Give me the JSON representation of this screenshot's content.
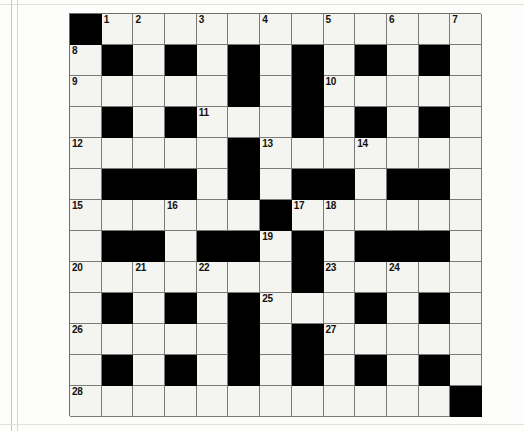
{
  "puzzle": {
    "title": "Crossword Grid",
    "rows": 13,
    "columns": 13,
    "cell_size_px": 31,
    "colors": {
      "block": "#000000",
      "open_cell": "#f4f4f0",
      "grid_line": "#7a7a7a",
      "number_text": "#111111",
      "paper": "#fdfdfb"
    },
    "grid": [
      [
        "#",
        "1",
        "2",
        "",
        "3",
        "",
        "4",
        "",
        "5",
        "",
        "6",
        "",
        "7"
      ],
      [
        "8",
        "#",
        "",
        "#",
        "",
        "#",
        "",
        "#",
        "",
        "#",
        "",
        "#",
        ""
      ],
      [
        "9",
        "",
        "",
        "",
        "",
        "#",
        "",
        "#",
        "10",
        "",
        "",
        "",
        ""
      ],
      [
        "",
        "#",
        "",
        "#",
        "11",
        "",
        "",
        "#",
        "",
        "#",
        "",
        "#",
        ""
      ],
      [
        "12",
        "",
        "",
        "",
        "",
        "#",
        "13",
        "",
        "",
        "14",
        "",
        "",
        ""
      ],
      [
        "",
        "#",
        "#",
        "#",
        "",
        "#",
        "",
        "#",
        "#",
        "",
        "#",
        "#",
        ""
      ],
      [
        "15",
        "",
        "",
        "16",
        "",
        "",
        "#",
        "17",
        "18",
        "",
        "",
        "",
        ""
      ],
      [
        "",
        "#",
        "#",
        "",
        "#",
        "#",
        "19",
        "#",
        "",
        "#",
        "#",
        "#",
        ""
      ],
      [
        "20",
        "",
        "21",
        "",
        "22",
        "",
        "",
        "#",
        "23",
        "",
        "24",
        "",
        ""
      ],
      [
        "",
        "#",
        "",
        "#",
        "",
        "#",
        "25",
        "",
        "",
        "#",
        "",
        "#",
        ""
      ],
      [
        "26",
        "",
        "",
        "",
        "",
        "#",
        "",
        "#",
        "27",
        "",
        "",
        "",
        ""
      ],
      [
        "",
        "#",
        "",
        "#",
        "",
        "#",
        "",
        "#",
        "",
        "#",
        "",
        "#",
        ""
      ],
      [
        "28",
        "",
        "",
        "",
        "",
        "",
        "",
        "",
        "",
        "",
        "",
        "",
        "#"
      ]
    ],
    "clue_numbers": [
      1,
      2,
      3,
      4,
      5,
      6,
      7,
      8,
      9,
      10,
      11,
      12,
      13,
      14,
      15,
      16,
      17,
      18,
      19,
      20,
      21,
      22,
      23,
      24,
      25,
      26,
      27,
      28
    ],
    "numbered_cells": [
      {
        "number": "1",
        "row": 1,
        "col": 2
      },
      {
        "number": "2",
        "row": 1,
        "col": 3
      },
      {
        "number": "3",
        "row": 1,
        "col": 5
      },
      {
        "number": "4",
        "row": 1,
        "col": 7
      },
      {
        "number": "5",
        "row": 1,
        "col": 9
      },
      {
        "number": "6",
        "row": 1,
        "col": 11
      },
      {
        "number": "7",
        "row": 1,
        "col": 13
      },
      {
        "number": "8",
        "row": 2,
        "col": 1
      },
      {
        "number": "9",
        "row": 3,
        "col": 1
      },
      {
        "number": "10",
        "row": 3,
        "col": 9
      },
      {
        "number": "11",
        "row": 4,
        "col": 5
      },
      {
        "number": "12",
        "row": 5,
        "col": 1
      },
      {
        "number": "13",
        "row": 5,
        "col": 7
      },
      {
        "number": "14",
        "row": 5,
        "col": 10
      },
      {
        "number": "15",
        "row": 7,
        "col": 1
      },
      {
        "number": "16",
        "row": 7,
        "col": 4
      },
      {
        "number": "17",
        "row": 7,
        "col": 8
      },
      {
        "number": "18",
        "row": 7,
        "col": 9
      },
      {
        "number": "19",
        "row": 8,
        "col": 7
      },
      {
        "number": "20",
        "row": 9,
        "col": 1
      },
      {
        "number": "21",
        "row": 9,
        "col": 3
      },
      {
        "number": "22",
        "row": 9,
        "col": 5
      },
      {
        "number": "23",
        "row": 9,
        "col": 9
      },
      {
        "number": "24",
        "row": 9,
        "col": 11
      },
      {
        "number": "25",
        "row": 10,
        "col": 7
      },
      {
        "number": "26",
        "row": 11,
        "col": 1
      },
      {
        "number": "27",
        "row": 11,
        "col": 9
      },
      {
        "number": "28",
        "row": 13,
        "col": 1
      }
    ]
  }
}
